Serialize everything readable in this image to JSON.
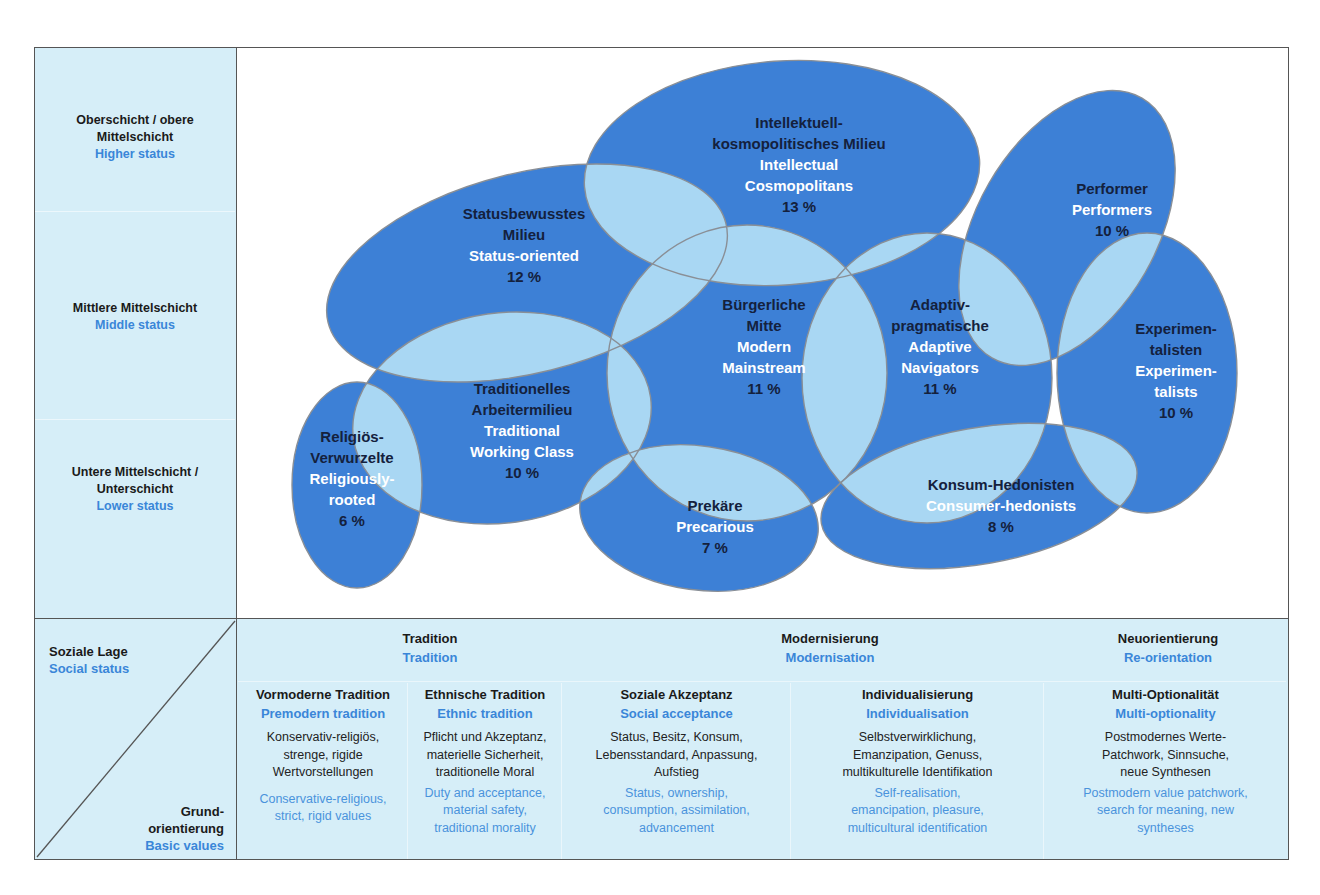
{
  "social_status_axis": {
    "bands": [
      {
        "de": "Oberschicht / obere Mittelschicht",
        "de_lines": [
          "Oberschicht / obere",
          "Mittelschicht"
        ],
        "en": "Higher status"
      },
      {
        "de": "Mittlere Mittelschicht",
        "de_lines": [
          "Mittlere Mittelschicht"
        ],
        "en": "Middle status"
      },
      {
        "de": "Untere Mittelschicht / Unterschicht",
        "de_lines": [
          "Untere Mittelschicht /",
          "Unterschicht"
        ],
        "en": "Lower status"
      }
    ]
  },
  "milieus": [
    {
      "id": "intellectual",
      "de_lines": [
        "Intellektuell-",
        "kosmopolitisches Milieu"
      ],
      "en_lines": [
        "Intellectual",
        "Cosmopolitans"
      ],
      "pct": "13 %"
    },
    {
      "id": "performer",
      "de_lines": [
        "Performer"
      ],
      "en_lines": [
        "Performers"
      ],
      "pct": "10 %"
    },
    {
      "id": "status",
      "de_lines": [
        "Statusbewusstes",
        "Milieu"
      ],
      "en_lines": [
        "Status-oriented"
      ],
      "pct": "12 %"
    },
    {
      "id": "buergerlich",
      "de_lines": [
        "Bürgerliche",
        "Mitte"
      ],
      "en_lines": [
        "Modern",
        "Mainstream"
      ],
      "pct": "11 %"
    },
    {
      "id": "adaptiv",
      "de_lines": [
        "Adaptiv-",
        "pragmatische"
      ],
      "en_lines": [
        "Adaptive",
        "Navigators"
      ],
      "pct": "11 %"
    },
    {
      "id": "experimentalisten",
      "de_lines": [
        "Experimen-",
        "talisten"
      ],
      "en_lines": [
        "Experimen-",
        "talists"
      ],
      "pct": "10 %"
    },
    {
      "id": "traditionell",
      "de_lines": [
        "Traditionelles",
        "Arbeitermilieu"
      ],
      "en_lines": [
        "Traditional",
        "Working Class"
      ],
      "pct": "10 %"
    },
    {
      "id": "religioes",
      "de_lines": [
        "Religiös-",
        "Verwurzelte"
      ],
      "en_lines": [
        "Religiously-",
        "rooted"
      ],
      "pct": "6 %"
    },
    {
      "id": "prekaere",
      "de_lines": [
        "Prekäre"
      ],
      "en_lines": [
        "Precarious"
      ],
      "pct": "7 %"
    },
    {
      "id": "konsum",
      "de_lines": [
        "Konsum-Hedonisten"
      ],
      "en_lines": [
        "Consumer-hedonists"
      ],
      "pct": "8 %"
    }
  ],
  "table": {
    "corner": {
      "top_de": "Soziale Lage",
      "top_en": "Social status",
      "bottom_de_lines": [
        "Grund-",
        "orientierung"
      ],
      "bottom_en": "Basic values"
    },
    "groups": [
      {
        "de": "Tradition",
        "en": "Tradition"
      },
      {
        "de": "Modernisierung",
        "en": "Modernisation"
      },
      {
        "de": "Neuorientierung",
        "en": "Re-orientation"
      }
    ],
    "columns": [
      {
        "de": "Vormoderne Tradition",
        "en": "Premodern tradition",
        "desc_de": [
          "Konservativ-religiös,",
          "strenge, rigide",
          "Wertvorstellungen"
        ],
        "desc_en": [
          "Conservative-religious,",
          "strict, rigid values"
        ]
      },
      {
        "de": "Ethnische Tradition",
        "en": "Ethnic tradition",
        "desc_de": [
          "Pflicht und Akzeptanz,",
          "materielle Sicherheit,",
          "traditionelle Moral"
        ],
        "desc_en": [
          "Duty and acceptance,",
          "material safety,",
          "traditional morality"
        ]
      },
      {
        "de": "Soziale Akzeptanz",
        "en": "Social acceptance",
        "desc_de": [
          "Status, Besitz, Konsum,",
          "Lebensstandard, Anpassung,",
          "Aufstieg"
        ],
        "desc_en": [
          "Status, ownership,",
          "consumption, assimilation,",
          "advancement"
        ]
      },
      {
        "de": "Individualisierung",
        "en": "Individualisation",
        "desc_de": [
          "Selbstverwirklichung,",
          "Emanzipation, Genuss,",
          "multikulturelle Identifikation"
        ],
        "desc_en": [
          "Self-realisation,",
          "emancipation, pleasure,",
          "multicultural identification"
        ]
      },
      {
        "de": "Multi-Optionalität",
        "en": "Multi-optionality",
        "desc_de": [
          "Postmodernes Werte-",
          "Patchwork, Sinnsuche,",
          "neue Synthesen"
        ],
        "desc_en": [
          "Postmodern value patchwork,",
          "search for meaning, new",
          "syntheses"
        ]
      }
    ]
  },
  "colors": {
    "milieu_fill": "#3d80d6",
    "overlap_fill": "#a9d7f3",
    "outline": "#8a8f96",
    "panel_bg": "#d6eef8",
    "label_dark": "#14213d",
    "label_english": "#ffffff",
    "table_english": "#3a86d8"
  }
}
